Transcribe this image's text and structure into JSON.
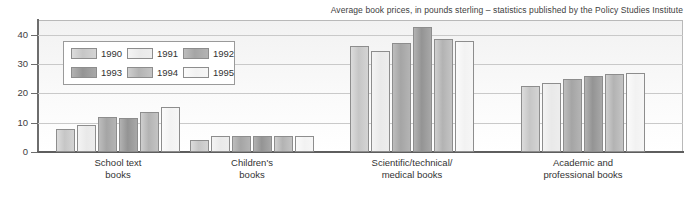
{
  "chart_data": {
    "type": "bar",
    "title": "Average book prices, in pounds sterling – statistics published by the Policy Studies Institute",
    "xlabel": "",
    "ylabel": "",
    "ylim": [
      0,
      45
    ],
    "yticks": [
      0,
      10,
      20,
      30,
      40
    ],
    "grid": true,
    "legend_position": "upper-left-inside",
    "categories": [
      "School text books",
      "Children's books",
      "Scientific/technical/ medical books",
      "Academic and professional books"
    ],
    "category_lines": [
      [
        "School text",
        "books"
      ],
      [
        "Children's",
        "books"
      ],
      [
        "Scientific/technical/",
        "medical books"
      ],
      [
        "Academic and",
        "professional books"
      ]
    ],
    "series": [
      {
        "name": "1990",
        "values": [
          8.0,
          4.2,
          36.0,
          22.5
        ]
      },
      {
        "name": "1991",
        "values": [
          9.2,
          5.3,
          34.5,
          23.5
        ]
      },
      {
        "name": "1992",
        "values": [
          11.8,
          5.4,
          37.0,
          25.0
        ]
      },
      {
        "name": "1993",
        "values": [
          11.5,
          5.4,
          42.5,
          25.8
        ]
      },
      {
        "name": "1994",
        "values": [
          13.6,
          5.4,
          38.5,
          26.5
        ]
      },
      {
        "name": "1995",
        "values": [
          15.5,
          5.5,
          38.0,
          27.0
        ]
      }
    ]
  },
  "legend": {
    "items": [
      {
        "label": "1990"
      },
      {
        "label": "1991"
      },
      {
        "label": "1992"
      },
      {
        "label": "1993"
      },
      {
        "label": "1994"
      },
      {
        "label": "1995"
      }
    ]
  },
  "axis": {
    "y_tick_labels": [
      "40",
      "30",
      "20",
      "10",
      "0"
    ]
  }
}
